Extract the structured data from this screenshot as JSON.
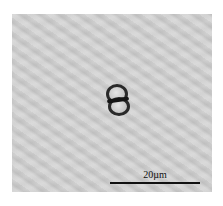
{
  "image": {
    "subject": "dividing cell micrograph",
    "background_color": "#cfcfcf"
  },
  "scale_bar": {
    "label": "20µm"
  }
}
